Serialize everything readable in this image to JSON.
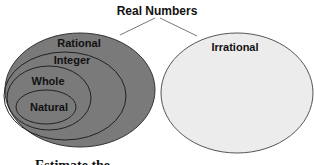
{
  "title": "Real Numbers",
  "sets": {
    "rational": "Rational",
    "integer": "Integer",
    "whole": "Whole",
    "natural": "Natural",
    "irrational": "Irrational"
  },
  "caption": "Estimate the",
  "colors": {
    "rational_fill": "#7a7a7a",
    "irrational_fill": "#ececec",
    "stroke": "#333333"
  }
}
